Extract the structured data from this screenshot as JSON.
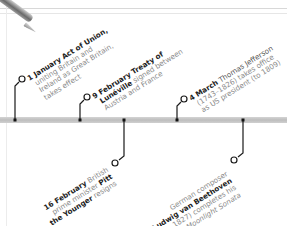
{
  "timeline": {
    "colors": {
      "bar": "#c8c8c8",
      "connector": "#1a1a1a",
      "event_bold": "#222222",
      "event_text": "#8a8a8a",
      "background": "#ffffff"
    },
    "events_above": [
      {
        "date": "1 January",
        "bold": "Act of Union,",
        "lines": [
          "uniting Britain and",
          "Ireland as Great Britain,",
          "takes effect"
        ]
      },
      {
        "date": "9 February",
        "bold": "Treaty of",
        "bold2": "Lunéville",
        "lines_rest": "signed between",
        "lines": [
          "Austria and France"
        ]
      },
      {
        "date": "4 March",
        "bold": "Thomas Jefferson",
        "lines": [
          "(1743–1826) takes office",
          "as US president (to 1809)"
        ]
      }
    ],
    "events_below": [
      {
        "date": "16 February",
        "text1": "British",
        "line2a": "prime minister",
        "line2b": "Pitt",
        "line3a": "the Younger",
        "line3b": "resigns"
      },
      {
        "line1": "German composer",
        "bold": "Ludwig van Beethoven",
        "line3": "(1770–1827) completes his",
        "italic": "Moonlight Sonata"
      }
    ]
  }
}
